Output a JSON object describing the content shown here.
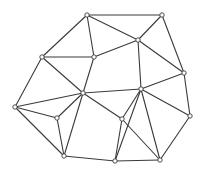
{
  "diagram": {
    "type": "triangulated-mesh",
    "colors": {
      "background": "#ffffff",
      "edge": "#3a3a3a",
      "node_fill": "#ffffff",
      "node_stroke": "#3a3a3a"
    },
    "node_radius": 2.2,
    "nodes": [
      {
        "id": "A",
        "x": 87,
        "y": 15
      },
      {
        "id": "B",
        "x": 162,
        "y": 15
      },
      {
        "id": "C",
        "x": 42,
        "y": 57
      },
      {
        "id": "D",
        "x": 94,
        "y": 57
      },
      {
        "id": "E",
        "x": 138,
        "y": 40
      },
      {
        "id": "F",
        "x": 184,
        "y": 73
      },
      {
        "id": "G",
        "x": 15,
        "y": 107
      },
      {
        "id": "H",
        "x": 83,
        "y": 93
      },
      {
        "id": "I",
        "x": 141,
        "y": 89
      },
      {
        "id": "J",
        "x": 57,
        "y": 118
      },
      {
        "id": "K",
        "x": 122,
        "y": 119
      },
      {
        "id": "L",
        "x": 190,
        "y": 116
      },
      {
        "id": "M",
        "x": 64,
        "y": 156
      },
      {
        "id": "N",
        "x": 115,
        "y": 161
      },
      {
        "id": "O",
        "x": 160,
        "y": 160
      }
    ],
    "edges": [
      [
        "A",
        "B"
      ],
      [
        "A",
        "C"
      ],
      [
        "A",
        "D"
      ],
      [
        "A",
        "E"
      ],
      [
        "B",
        "E"
      ],
      [
        "B",
        "F"
      ],
      [
        "C",
        "D"
      ],
      [
        "C",
        "G"
      ],
      [
        "C",
        "H"
      ],
      [
        "D",
        "E"
      ],
      [
        "D",
        "H"
      ],
      [
        "E",
        "I"
      ],
      [
        "E",
        "F"
      ],
      [
        "F",
        "I"
      ],
      [
        "F",
        "L"
      ],
      [
        "G",
        "H"
      ],
      [
        "G",
        "J"
      ],
      [
        "G",
        "M"
      ],
      [
        "H",
        "J"
      ],
      [
        "H",
        "M"
      ],
      [
        "H",
        "I"
      ],
      [
        "H",
        "K"
      ],
      [
        "I",
        "K"
      ],
      [
        "I",
        "N"
      ],
      [
        "I",
        "O"
      ],
      [
        "I",
        "L"
      ],
      [
        "J",
        "M"
      ],
      [
        "K",
        "N"
      ],
      [
        "K",
        "O"
      ],
      [
        "L",
        "O"
      ],
      [
        "M",
        "N"
      ],
      [
        "N",
        "O"
      ]
    ]
  }
}
